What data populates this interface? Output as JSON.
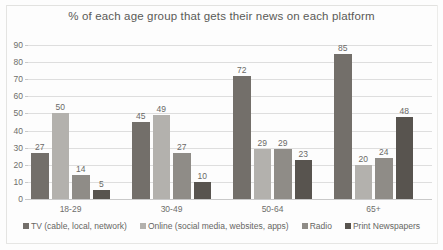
{
  "chart_data": {
    "type": "bar",
    "title": "% of each age group that gets their news on each platform",
    "xlabel": "",
    "ylabel": "",
    "ylim": [
      0,
      90
    ],
    "ytick_step": 10,
    "yticks": [
      0,
      10,
      20,
      30,
      40,
      50,
      60,
      70,
      80,
      90
    ],
    "grid": true,
    "legend_position": "bottom",
    "categories": [
      "18-29",
      "30-49",
      "50-64",
      "65+"
    ],
    "series": [
      {
        "name": "TV (cable, local, network)",
        "color": "#736f6a",
        "values": [
          27,
          45,
          72,
          85
        ]
      },
      {
        "name": "Online (social media, websites, apps)",
        "color": "#b3b1ad",
        "values": [
          50,
          49,
          29,
          20
        ]
      },
      {
        "name": "Radio",
        "color": "#8f8c87",
        "values": [
          14,
          27,
          29,
          24
        ]
      },
      {
        "name": "Print Newspapers",
        "color": "#58544f",
        "values": [
          5,
          10,
          23,
          48
        ]
      }
    ]
  }
}
